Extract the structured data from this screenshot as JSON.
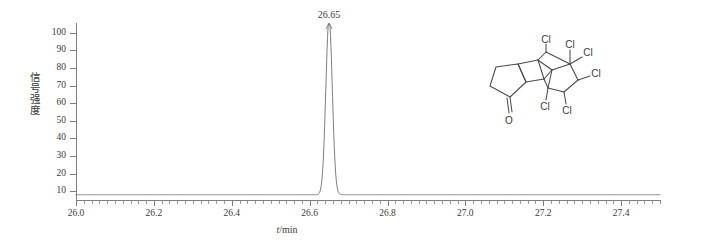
{
  "chart_data": {
    "type": "line",
    "title": "",
    "xlabel": "t/min",
    "ylabel": "信号强度",
    "xlim": [
      26.0,
      27.5
    ],
    "ylim": [
      5,
      105
    ],
    "grid": false,
    "legend": null,
    "x_ticks": [
      "26.0",
      "26.2",
      "26.4",
      "26.6",
      "26.8",
      "27.0",
      "27.2",
      "27.4"
    ],
    "x_tick_values": [
      26.0,
      26.2,
      26.4,
      26.6,
      26.8,
      27.0,
      27.2,
      27.4
    ],
    "x_minor_step": 0.02,
    "y_ticks": [
      "100",
      "90",
      "80",
      "70",
      "60",
      "50",
      "40",
      "30",
      "20",
      "10"
    ],
    "y_tick_values": [
      100,
      90,
      80,
      70,
      60,
      50,
      40,
      30,
      20,
      10
    ],
    "series": [
      {
        "name": "chromatogram",
        "color": "#6e6e6e",
        "baseline": 8,
        "peaks": [
          {
            "retention_time": 26.65,
            "height": 100,
            "width_half_max": 0.0195,
            "label": "26.65"
          }
        ]
      }
    ],
    "annotations": [
      {
        "kind": "peak-label",
        "text": "26.65",
        "x": 26.65,
        "y": 100
      }
    ]
  },
  "axes": {
    "y_title": "信号强度",
    "x_title_symbol": "t",
    "x_title_rest": "/min"
  },
  "molecule": {
    "name": "chlordecone-structure",
    "oxygen_label": "O",
    "chlorine_labels": [
      "Cl",
      "Cl",
      "Cl",
      "Cl",
      "Cl",
      "Cl"
    ]
  },
  "colors": {
    "trace": "#6e6e6e",
    "axis": "#7d7d7d",
    "text": "#3a3a3a",
    "background": "#ffffff"
  }
}
